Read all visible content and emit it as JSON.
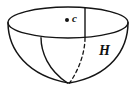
{
  "figure": {
    "type": "geometry-diagram",
    "background_color": "#ffffff",
    "stroke_color": "#141414",
    "labels": {
      "center_point": "c",
      "height": "H"
    },
    "icons": {
      "center_dot": "filled-dot-marker"
    },
    "geometry": {
      "rim_ellipse": {
        "center_x": 68,
        "center_y": 22.5,
        "radius_x": 60,
        "radius_y": 15.5
      },
      "bowl_bottom": {
        "x": 69,
        "y": 83
      },
      "height_line": {
        "x": 85,
        "y_top": 7,
        "y_bottom": 38
      },
      "center_dot": {
        "x": 67,
        "y": 20,
        "radius": 2
      }
    }
  }
}
